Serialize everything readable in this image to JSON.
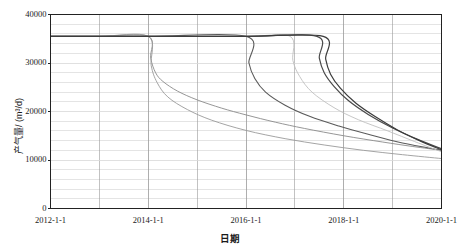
{
  "chart_data": {
    "type": "line",
    "title": "",
    "xlabel": "日期",
    "ylabel": "产气量/ (m³/d)",
    "grid": true,
    "legend": "none",
    "xlim": [
      "2012-1-1",
      "2020-1-1"
    ],
    "ylim": [
      0,
      40000
    ],
    "x_ticks": [
      "2012-1-1",
      "2014-1-1",
      "2016-1-1",
      "2018-1-1",
      "2020-1-1"
    ],
    "x_tick_values": [
      2012.0,
      2014.0,
      2016.0,
      2018.0,
      2020.0
    ],
    "x_minor_gridline_values": [
      2013.0,
      2015.0,
      2017.0,
      2019.0
    ],
    "y_ticks": [
      "0",
      "10000",
      "20000",
      "30000",
      "40000"
    ],
    "y_tick_values": [
      0,
      10000,
      20000,
      30000,
      40000
    ],
    "y_minor_step": 2000,
    "plateau_rate": 35500,
    "terminal_rate": 12000,
    "series": [
      {
        "name": "方案1",
        "color": "#8a8a8a",
        "width": 0.9,
        "plateau_end": 2014.0,
        "plateau_value": 35500,
        "end_value": 10300,
        "decline_shape": 0.58,
        "points_x": [
          2012.0,
          2013.0,
          2014.0,
          2014.05,
          2014.15,
          2014.3,
          2014.6,
          2015.0,
          2015.5,
          2016.0,
          2016.6,
          2017.2,
          2018.0,
          2018.8,
          2019.4,
          2020.0
        ],
        "points_y": [
          35500,
          35500,
          35500,
          31000,
          28000,
          26200,
          24200,
          22400,
          20700,
          19300,
          17800,
          16500,
          15000,
          13700,
          12800,
          12000
        ]
      },
      {
        "name": "方案2",
        "color": "#9a9a9a",
        "width": 0.9,
        "plateau_end": 2014.0,
        "plateau_value": 35500,
        "end_value": 10300,
        "decline_shape": 0.42,
        "points_x": [
          2012.0,
          2013.0,
          2014.0,
          2014.06,
          2014.18,
          2014.4,
          2014.8,
          2015.3,
          2016.0,
          2016.8,
          2017.6,
          2018.4,
          2019.2,
          2020.0
        ],
        "points_y": [
          35500,
          35500,
          35500,
          29500,
          26000,
          23000,
          20400,
          18200,
          16100,
          14400,
          13100,
          12000,
          11100,
          10300
        ]
      },
      {
        "name": "方案3",
        "color": "#5a5a5a",
        "width": 1.1,
        "plateau_end": 2016.0,
        "plateau_value": 35500,
        "end_value": 12000,
        "decline_shape": 0.55,
        "points_x": [
          2012.0,
          2014.0,
          2016.0,
          2016.06,
          2016.18,
          2016.4,
          2016.8,
          2017.3,
          2017.9,
          2018.5,
          2019.2,
          2020.0
        ],
        "points_y": [
          35500,
          35500,
          35500,
          30000,
          26800,
          24000,
          21300,
          19000,
          17000,
          15300,
          13500,
          12000
        ]
      },
      {
        "name": "方案4",
        "color": "#bfbfbf",
        "width": 0.9,
        "plateau_end": 2016.9,
        "plateau_value": 35500,
        "end_value": 11700,
        "decline_shape": 0.5,
        "points_x": [
          2012.0,
          2014.0,
          2016.0,
          2016.9,
          2016.96,
          2017.1,
          2017.35,
          2017.8,
          2018.3,
          2018.9,
          2019.45,
          2020.0
        ],
        "points_y": [
          35500,
          35500,
          35500,
          35500,
          30500,
          27200,
          24000,
          20800,
          18300,
          16000,
          13800,
          11700
        ]
      },
      {
        "name": "方案5",
        "color": "#4a4a4a",
        "width": 1.2,
        "plateau_end": 2017.45,
        "plateau_value": 35500,
        "end_value": 12300,
        "decline_shape": 0.5,
        "points_x": [
          2012.0,
          2014.0,
          2016.0,
          2017.45,
          2017.5,
          2017.6,
          2017.8,
          2018.1,
          2018.5,
          2019.0,
          2019.5,
          2020.0
        ],
        "points_y": [
          35500,
          35500,
          35500,
          35500,
          31000,
          28000,
          25200,
          22200,
          19400,
          16600,
          14300,
          12300
        ]
      },
      {
        "name": "方案6",
        "color": "#3c3c3c",
        "width": 1.2,
        "plateau_end": 2017.58,
        "plateau_value": 35500,
        "end_value": 12100,
        "decline_shape": 0.5,
        "points_x": [
          2012.0,
          2014.0,
          2016.0,
          2017.58,
          2017.63,
          2017.73,
          2017.93,
          2018.25,
          2018.65,
          2019.1,
          2019.55,
          2020.0
        ],
        "points_y": [
          35500,
          35500,
          35500,
          35500,
          30800,
          27700,
          24800,
          21700,
          18900,
          16200,
          14000,
          12100
        ]
      }
    ]
  },
  "axis": {
    "frame_color": "#222222",
    "major_grid_color": "#9a9a9a",
    "minor_grid_color": "#d8d8d8"
  }
}
